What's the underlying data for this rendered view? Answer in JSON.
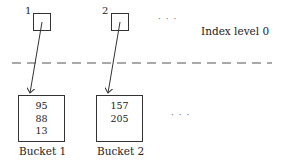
{
  "diagram": {
    "index_level_label": "Index level 0",
    "index_entries": [
      {
        "label": "1"
      },
      {
        "label": "2"
      }
    ],
    "index_ellipsis": "· · ·",
    "buckets": [
      {
        "label": "Bucket 1",
        "values": [
          "95",
          "88",
          "13"
        ]
      },
      {
        "label": "Bucket 2",
        "values": [
          "157",
          "205"
        ]
      }
    ],
    "bucket_ellipsis": "· · ·",
    "colors": {
      "line": "#333333",
      "dash": "#555555"
    }
  }
}
